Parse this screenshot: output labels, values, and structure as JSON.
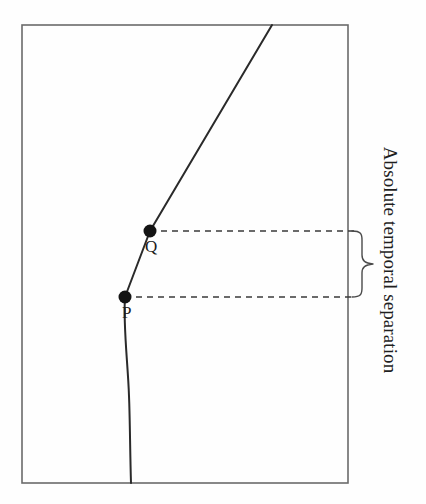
{
  "figure": {
    "background_color": "#fefefe",
    "frame": {
      "name": "spacetime-frame",
      "x": 22,
      "y": 25,
      "width": 326,
      "height": 458,
      "stroke_color": "#6b6b6b",
      "stroke_width": 1.6
    },
    "caption": {
      "text": "Absolute temporal separation",
      "rotation_degrees": 90,
      "color": "#1f1f1f",
      "font_size": 19
    },
    "worldline": {
      "name": "worldline-curve",
      "stroke_color": "#2a2a2a",
      "stroke_width": 2.0,
      "path": "M 131 483 C 130 450 130 420 129 396 C 128 364 123 326 125 297 L 150 231 L 272 25",
      "description": "curved worldline rising from bottom border through P and Q and exiting the top border"
    },
    "points": [
      {
        "name": "point-p",
        "label": "P",
        "x": 125,
        "y": 297,
        "radius": 6.5,
        "fill": "#141414",
        "label_x": 122,
        "label_y": 304
      },
      {
        "name": "point-q",
        "label": "Q",
        "x": 150,
        "y": 231,
        "radius": 6.5,
        "fill": "#141414",
        "label_x": 145,
        "label_y": 238
      }
    ],
    "dashed_lines": [
      {
        "name": "dashed-line-q",
        "from_x": 150,
        "from_y": 231,
        "to_x": 355,
        "to_y": 231,
        "stroke_color": "#3a3a3a",
        "dash_pattern": "6 5"
      },
      {
        "name": "dashed-line-p",
        "from_x": 125,
        "from_y": 297,
        "to_x": 355,
        "to_y": 297,
        "stroke_color": "#3a3a3a",
        "dash_pattern": "6 5"
      }
    ],
    "brace": {
      "name": "separation-brace",
      "top_y": 231,
      "bottom_y": 297,
      "left_x": 352,
      "tip_x": 373,
      "tip_y": 264,
      "stroke_color": "#4a4a4a",
      "stroke_width": 1.4
    }
  }
}
